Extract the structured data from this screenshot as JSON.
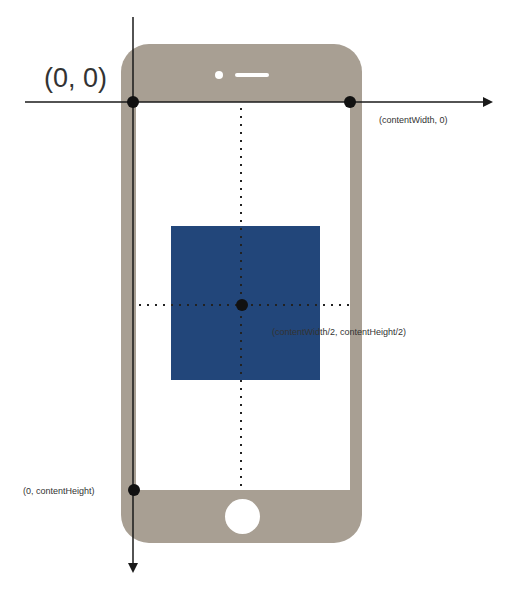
{
  "diagram": {
    "labels": {
      "origin": "(0, 0)",
      "top_right": "(contentWidth, 0)",
      "center": "(contentWidth/2, contentHeight/2)",
      "bottom_left": "(0, contentHeight)"
    },
    "colors": {
      "phone_body": "#a89f93",
      "content_square": "#22467a",
      "axis": "#1a1a1a",
      "points": "#111111",
      "background": "#ffffff"
    },
    "axes": {
      "x_axis": "horizontal arrow pointing right along top of content area",
      "y_axis": "vertical arrow pointing down along left edge of content area"
    },
    "points": [
      "origin",
      "top_right",
      "center",
      "bottom_left"
    ]
  }
}
